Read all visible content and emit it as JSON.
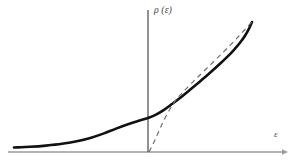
{
  "figure": {
    "background_color": "#ffffff",
    "width": 296,
    "height": 163
  },
  "axes": {
    "y_axis": {
      "label": "ρ (ε)",
      "color": "#3a3a3a",
      "x_position": 148,
      "top": 10,
      "bottom": 152
    },
    "x_axis": {
      "label": "ε",
      "color": "#9a9a9a",
      "y_position": 152,
      "left": 8,
      "right": 286,
      "arrow": "right-arrow"
    }
  },
  "chart_data": {
    "type": "line",
    "title": "",
    "xlabel": "ε",
    "ylabel": "ρ (ε)",
    "grid": false,
    "legend": false,
    "xlim": [
      -148,
      148
    ],
    "ylim": [
      0,
      142
    ],
    "origin_px": [
      148,
      152
    ],
    "series": [
      {
        "name": "density-of-states-solid",
        "style": "solid",
        "color": "#111111",
        "width": 2.6,
        "points_px": [
          [
            14,
            147.5
          ],
          [
            30,
            146.8
          ],
          [
            46,
            145.6
          ],
          [
            62,
            143.8
          ],
          [
            78,
            141.0
          ],
          [
            92,
            137.4
          ],
          [
            104,
            133.4
          ],
          [
            116,
            128.6
          ],
          [
            128,
            124.2
          ],
          [
            138,
            121.0
          ],
          [
            148,
            118.0
          ],
          [
            156,
            114.6
          ],
          [
            164,
            109.8
          ],
          [
            172,
            104.0
          ],
          [
            180,
            98.0
          ],
          [
            190,
            89.8
          ],
          [
            200,
            81.4
          ],
          [
            210,
            72.8
          ],
          [
            220,
            63.8
          ],
          [
            228,
            56.2
          ],
          [
            234,
            49.8
          ],
          [
            240,
            42.8
          ],
          [
            245,
            35.8
          ],
          [
            249,
            28.6
          ],
          [
            252,
            22.0
          ]
        ]
      },
      {
        "name": "tangent-asymptote-dashed",
        "style": "dashed",
        "color": "#6e6e6e",
        "width": 1.2,
        "dash_pattern": "5,4",
        "points_px": [
          [
            149,
            152.0
          ],
          [
            154,
            142.0
          ],
          [
            159,
            131.0
          ],
          [
            164,
            120.0
          ],
          [
            170,
            109.0
          ],
          [
            176,
            100.0
          ],
          [
            183,
            92.0
          ],
          [
            192,
            82.8
          ],
          [
            202,
            73.0
          ],
          [
            212,
            63.2
          ],
          [
            222,
            53.4
          ],
          [
            231,
            44.4
          ],
          [
            239,
            36.0
          ],
          [
            246,
            28.4
          ],
          [
            252,
            21.6
          ]
        ]
      }
    ],
    "annotations": [
      {
        "name": "curve-crossing",
        "description": "dashed curve crosses and rises above solid curve",
        "px": [
          185,
          95
        ]
      },
      {
        "name": "curve-rejoin",
        "description": "dashed and solid curves converge at upper right endpoint",
        "px": [
          252,
          22
        ]
      }
    ]
  }
}
